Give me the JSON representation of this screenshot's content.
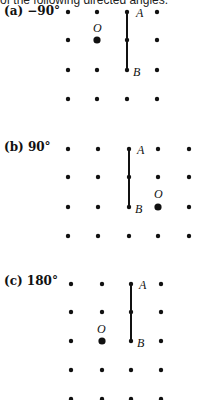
{
  "header": {
    "cutoff_text": "of the following directed angles."
  },
  "parts": [
    {
      "label": "(a) −90°",
      "point_A": "A",
      "point_B": "B",
      "center": "O"
    },
    {
      "label": "(b) 90°",
      "point_A": "A",
      "point_B": "B",
      "center": "O"
    },
    {
      "label": "(c) 180°",
      "point_A": "A",
      "point_B": "B",
      "center": "O"
    }
  ]
}
